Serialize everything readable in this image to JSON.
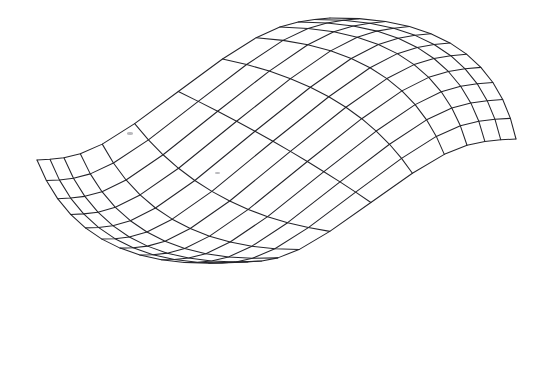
{
  "figure": {
    "kind": "3d-wireframe-surface",
    "title": "",
    "background_color": "#ffffff",
    "line_color": "#24242a",
    "line_width_px": 1,
    "width_px": 538,
    "height_px": 375
  },
  "chart_data": {
    "type": "line",
    "render_style": "wireframe-mesh",
    "title": "",
    "xlabel": "",
    "ylabel": "",
    "zlabel": "",
    "grid": false,
    "legend": null,
    "axes_shown": false,
    "tick_labels": [],
    "annotations": [],
    "surface": {
      "description": "Saddle-type surface with a sharp ridge peak at upper centre and a deep valley at lower centre-left; broad flat wings spreading to the left and right corners.",
      "formula": "z(u,v) = A * tanh(k*(u-u0)) * (1 - B*(v-v0)^2) + C*(v-v0)",
      "u_range": [
        -1,
        1
      ],
      "v_range": [
        -1,
        1
      ],
      "u_divisions": 12,
      "v_divisions": 11,
      "amplitude": 1.0
    },
    "projection": {
      "type": "oblique-perspective",
      "elevation_deg": 22,
      "azimuth_deg": 38,
      "origin_px": [
        262,
        196
      ],
      "scale_x_px": 196,
      "scale_y_px": 112,
      "scale_z_px": 150
    },
    "key_points_px": {
      "peak_apex": [
        330,
        18
      ],
      "left_corner": [
        37,
        160
      ],
      "right_corner": [
        516,
        139
      ],
      "valley_bottom": [
        140,
        370
      ],
      "front_fold": [
        268,
        312
      ]
    }
  },
  "artifacts": [
    {
      "name": "scan-speck",
      "x": 127,
      "y": 132,
      "w": 6,
      "h": 3
    },
    {
      "name": "scan-speck",
      "x": 215,
      "y": 172,
      "w": 5,
      "h": 2
    }
  ]
}
